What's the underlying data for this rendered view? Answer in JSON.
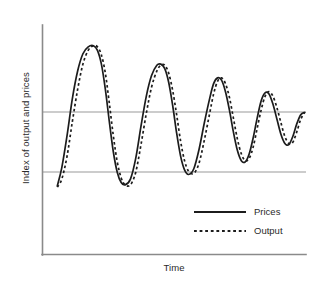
{
  "chart_data": {
    "type": "line",
    "title": "",
    "subtitle": "",
    "xlabel": "Time",
    "ylabel": "Index of output and prices",
    "grid": false,
    "legend_position": "inside-bottom-right",
    "xlim": [
      0,
      100
    ],
    "ylim": [
      0,
      100
    ],
    "axis_ticks": {
      "x": [],
      "y": []
    },
    "reference_lines": [
      {
        "name": "equilibrium-line",
        "orientation": "horizontal",
        "y": 57,
        "label": ""
      },
      {
        "name": "lower-reference-line",
        "orientation": "horizontal",
        "y": 30,
        "label": ""
      }
    ],
    "annotations": [],
    "series": [
      {
        "name": "Prices",
        "style": "solid",
        "color": "#1c1c1c",
        "x": [
          5.8,
          7.5,
          9.5,
          11.5,
          13.5,
          15.5,
          17.5,
          19.5,
          21.0,
          22.5,
          24.0,
          25.5,
          27.0,
          28.5,
          30.0,
          31.5,
          33.5,
          35.5,
          37.5,
          39.5,
          41.5,
          43.5,
          45.0,
          46.5,
          48.0,
          49.5,
          51.0,
          52.5,
          54.0,
          55.5,
          57.5,
          59.5,
          61.5,
          63.5,
          65.0,
          66.5,
          68.0,
          69.5,
          71.0,
          72.5,
          74.0,
          75.5,
          77.0,
          78.5,
          80.0,
          81.5,
          83.0,
          84.5,
          86.0,
          87.5,
          89.0,
          90.5,
          92.0,
          93.5,
          95.0,
          96.5,
          98.0,
          99.5
        ],
        "y": [
          30.0,
          38.0,
          52.0,
          68.0,
          80.0,
          87.5,
          90.5,
          91.0,
          89.0,
          83.0,
          72.0,
          58.0,
          45.0,
          36.0,
          31.5,
          30.5,
          33.0,
          42.0,
          56.0,
          69.0,
          78.0,
          82.5,
          83.0,
          81.0,
          75.0,
          65.0,
          53.0,
          43.0,
          37.0,
          35.0,
          37.5,
          46.0,
          57.5,
          68.0,
          74.5,
          77.0,
          76.0,
          71.0,
          63.0,
          53.5,
          45.5,
          41.0,
          40.5,
          44.0,
          51.0,
          59.5,
          67.0,
          70.5,
          70.0,
          65.5,
          59.0,
          52.5,
          48.5,
          48.0,
          51.5,
          57.0,
          61.0,
          62.0
        ]
      },
      {
        "name": "Output",
        "style": "dotted",
        "color": "#1c1c1c",
        "phase_lag": 3.2,
        "x": [
          5.8,
          7.5,
          9.5,
          11.5,
          13.5,
          15.5,
          17.5,
          19.5,
          21.0,
          22.5,
          24.0,
          25.5,
          27.0,
          28.5,
          30.0,
          31.5,
          33.5,
          35.5,
          37.5,
          39.5,
          41.5,
          43.5,
          45.0,
          46.5,
          48.0,
          49.5,
          51.0,
          52.5,
          54.0,
          55.5,
          57.5,
          59.5,
          61.5,
          63.5,
          65.0,
          66.5,
          68.0,
          69.5,
          71.0,
          72.5,
          74.0,
          75.5,
          77.0,
          78.5,
          80.0,
          81.5,
          83.0,
          84.5,
          86.0,
          87.5,
          89.0,
          90.5,
          92.0,
          93.5,
          95.0,
          96.5,
          98.0,
          99.5
        ],
        "y": [
          29.5,
          33.0,
          43.0,
          58.0,
          72.0,
          83.0,
          89.0,
          91.0,
          90.5,
          87.0,
          79.0,
          66.0,
          52.0,
          40.5,
          33.5,
          30.5,
          30.5,
          36.0,
          48.0,
          61.5,
          73.0,
          80.0,
          82.5,
          82.5,
          79.0,
          71.5,
          61.0,
          49.5,
          41.0,
          36.5,
          35.5,
          40.0,
          50.0,
          61.5,
          70.0,
          75.5,
          77.0,
          74.5,
          68.5,
          59.5,
          50.5,
          44.0,
          41.0,
          42.0,
          47.0,
          55.0,
          63.0,
          69.0,
          71.0,
          69.0,
          64.0,
          57.5,
          51.5,
          48.5,
          49.0,
          53.5,
          59.0,
          62.0
        ]
      }
    ]
  },
  "axes": {
    "y_label": "Index of output and prices",
    "x_label": "Time"
  },
  "legend": {
    "items": [
      {
        "label": "Prices",
        "style": "solid"
      },
      {
        "label": "Output",
        "style": "dotted"
      }
    ]
  },
  "colors": {
    "curve": "#1c1c1c",
    "axis": "#8a8a8a",
    "reference": "#9a9a9a",
    "text": "#2a2a2a",
    "background": "#ffffff"
  }
}
